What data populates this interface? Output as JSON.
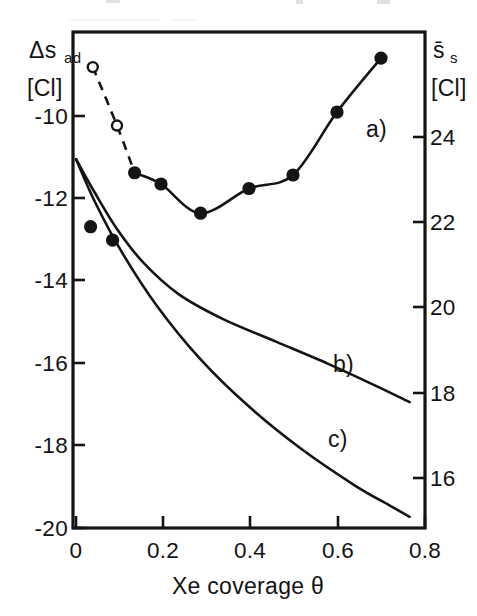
{
  "figure": {
    "background_color": "#ffffff",
    "ink_color": "#141414"
  },
  "axes": {
    "left": {
      "title": "Δs",
      "title_sub": "ad",
      "unit": "[Cl]",
      "tick_labels": [
        "-10",
        "-12",
        "-14",
        "-16",
        "-18",
        "-20"
      ]
    },
    "right": {
      "title": "s̄",
      "title_sub": "s",
      "unit": "[Cl]",
      "tick_labels": [
        "24",
        "22",
        "20",
        "18",
        "16"
      ]
    },
    "bottom": {
      "title": "Xe coverage θ",
      "tick_labels": [
        "0",
        "0.2",
        "0.4",
        "0.6",
        "0.8"
      ]
    }
  },
  "curve_labels": {
    "a": "a)",
    "b": "b)",
    "c": "c)"
  },
  "chart_data": {
    "type": "scatter",
    "title": "",
    "xlabel": "Xe coverage θ",
    "ylabel": "Δs_ad [Cl]",
    "ylabel_right": "s̄_s [Cl]",
    "xlim": [
      0,
      0.8
    ],
    "ylim": [
      -20,
      -8.97
    ],
    "ylim_right": [
      14.66,
      25.26
    ],
    "xticks": [
      0,
      0.2,
      0.4,
      0.6,
      0.8
    ],
    "yticks": [
      -20,
      -18,
      -16,
      -14,
      -12,
      -10
    ],
    "yticks_right": [
      16,
      18,
      20,
      22,
      24
    ],
    "grid": false,
    "legend": "inline-curve-labels",
    "series": [
      {
        "name": "a)",
        "label": "a)",
        "style": "solid-line-with-filled-markers",
        "marker": "filled-circle",
        "x": [
          0.14,
          0.2,
          0.29,
          0.4,
          0.5,
          0.6,
          0.7
        ],
        "y": [
          -12.1,
          -12.35,
          -13.0,
          -12.45,
          -12.15,
          -10.75,
          -9.55
        ]
      },
      {
        "name": "a-dashed-extrapolation",
        "label": "",
        "style": "dashed-line-with-open-markers",
        "marker": "open-circle",
        "x": [
          0.045,
          0.1,
          0.14
        ],
        "y": [
          -9.75,
          -11.05,
          -12.1
        ]
      },
      {
        "name": "low-coverage-points",
        "label": "",
        "style": "markers-only",
        "marker": "filled-circle",
        "x": [
          0.04,
          0.09
        ],
        "y": [
          -13.3,
          -13.6
        ]
      },
      {
        "name": "b)",
        "label": "b)",
        "style": "solid-line",
        "marker": "none",
        "x": [
          0.007,
          0.05,
          0.1,
          0.16,
          0.24,
          0.34,
          0.46,
          0.58,
          0.68,
          0.765
        ],
        "y": [
          -11.8,
          -12.55,
          -13.35,
          -14.1,
          -14.8,
          -15.35,
          -15.85,
          -16.35,
          -16.8,
          -17.2
        ]
      },
      {
        "name": "c)",
        "label": "c)",
        "style": "solid-line",
        "marker": "none",
        "x": [
          0.007,
          0.05,
          0.11,
          0.19,
          0.29,
          0.4,
          0.52,
          0.64,
          0.72,
          0.765
        ],
        "y": [
          -11.8,
          -12.75,
          -13.85,
          -15.05,
          -16.25,
          -17.3,
          -18.25,
          -19.05,
          -19.5,
          -19.75
        ]
      }
    ]
  }
}
